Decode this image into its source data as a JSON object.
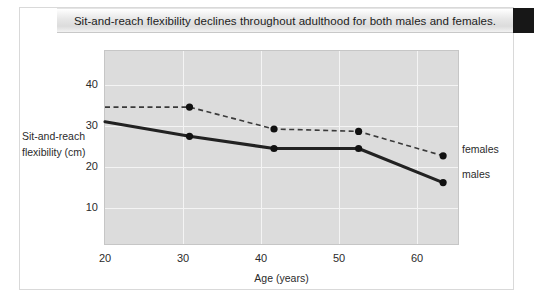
{
  "title": "Sit-and-reach flexibility declines throughout adulthood for both males and females.",
  "legend": {
    "females": "females",
    "males": "males"
  },
  "colors": {
    "plot_background": "#dcdcdc",
    "gridline": "#f4f4f4",
    "males_line": "#222222",
    "females_line": "#3a3a3a",
    "marker": "#111111",
    "title_block": "#171717",
    "frame_border": "#d9d9d9"
  },
  "chart_data": {
    "type": "line",
    "title": "Sit-and-reach flexibility declines throughout adulthood for both males and females.",
    "xlabel": "Age (years)",
    "ylabel": "Sit-and-reach flexibility (cm)",
    "x": [
      20,
      30,
      40,
      50,
      60
    ],
    "xticks": [
      20,
      30,
      40,
      50,
      60
    ],
    "yticks": [
      10,
      20,
      30,
      40
    ],
    "xlim": [
      20,
      62
    ],
    "ylim": [
      5,
      45
    ],
    "grid": true,
    "legend_position": "right",
    "series": [
      {
        "name": "females",
        "style": "dashed",
        "marker": "circle",
        "values": [
          33.5,
          33.5,
          29.0,
          28.5,
          23.5
        ]
      },
      {
        "name": "males",
        "style": "solid",
        "marker": "circle",
        "values": [
          30.5,
          27.5,
          25.0,
          25.0,
          18.0
        ]
      }
    ]
  }
}
